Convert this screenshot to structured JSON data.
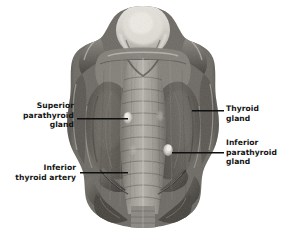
{
  "figure": {
    "kind": "anatomical-specimen-photograph",
    "background_color": "#ffffff",
    "label_text_color": "#141414",
    "leader_line_color": "#101010"
  },
  "labels": [
    {
      "id": "superior-parathyroid-gland",
      "text": "Superior\nparathyroid\ngland",
      "align": "right",
      "x": 14,
      "y": 101,
      "width": 60
    },
    {
      "id": "thyroid-gland",
      "text": "Thyroid\ngland",
      "align": "left",
      "x": 226,
      "y": 104,
      "width": 56
    },
    {
      "id": "inferior-parathyroid-gland",
      "text": "Inferior\nparathyroid\ngland",
      "align": "left",
      "x": 226,
      "y": 138,
      "width": 58
    },
    {
      "id": "inferior-thyroid-artery",
      "text": "Inferior\nthyroid artery",
      "align": "right",
      "x": 12,
      "y": 163,
      "width": 64
    }
  ],
  "leader_lines": [
    {
      "id": "leader-superior-parathyroid",
      "x": 77,
      "y": 118,
      "length": 51
    },
    {
      "id": "leader-thyroid-gland",
      "x": 192,
      "y": 110,
      "length": 32
    },
    {
      "id": "leader-inferior-parathyroid",
      "x": 172,
      "y": 152,
      "length": 52
    },
    {
      "id": "leader-inferior-thyroid-artery",
      "x": 80,
      "y": 172,
      "length": 48
    }
  ],
  "structures": [
    {
      "id": "larynx-epiglottis-dome",
      "note": "pale dome at superior midline"
    },
    {
      "id": "thyroid-lobe-left",
      "note": "dark rounded lateral mass"
    },
    {
      "id": "thyroid-lobe-right",
      "note": "dark rounded lateral mass"
    },
    {
      "id": "trachea",
      "note": "central vertically striated tube"
    },
    {
      "id": "superior-parathyroid-marker",
      "x": 128,
      "y": 118
    },
    {
      "id": "inferior-parathyroid-marker",
      "x": 168,
      "y": 150
    },
    {
      "id": "inferior-thyroid-artery-branches",
      "note": "lower vessel branching"
    }
  ]
}
